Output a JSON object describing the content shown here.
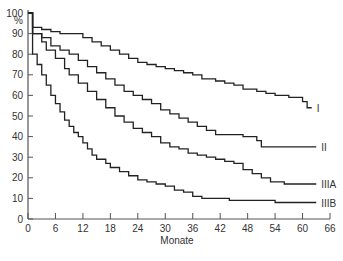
{
  "chart_data": {
    "type": "line",
    "style": "step (Kaplan-Meier survival curves)",
    "title": "",
    "xlabel": "Monate",
    "ylabel": "%",
    "xlim": [
      0,
      66
    ],
    "ylim": [
      0,
      100
    ],
    "x_ticks": [
      0,
      6,
      12,
      18,
      24,
      30,
      36,
      42,
      48,
      54,
      60,
      66
    ],
    "y_ticks": [
      0,
      10,
      20,
      30,
      40,
      50,
      60,
      70,
      80,
      90,
      100
    ],
    "grid": false,
    "legend": "inline labels at right end of each curve",
    "series": [
      {
        "name": "I",
        "points": [
          [
            0,
            100
          ],
          [
            1,
            97
          ],
          [
            1,
            93
          ],
          [
            3,
            92
          ],
          [
            5,
            91
          ],
          [
            7,
            90
          ],
          [
            10,
            90
          ],
          [
            12,
            88
          ],
          [
            14,
            86
          ],
          [
            16,
            84
          ],
          [
            18,
            82
          ],
          [
            20,
            80
          ],
          [
            22,
            78
          ],
          [
            24,
            76
          ],
          [
            26,
            75
          ],
          [
            28,
            74
          ],
          [
            30,
            73
          ],
          [
            32,
            72
          ],
          [
            34,
            71
          ],
          [
            36,
            70
          ],
          [
            38,
            68
          ],
          [
            41,
            67
          ],
          [
            43,
            66
          ],
          [
            45,
            65
          ],
          [
            47,
            63
          ],
          [
            50,
            62
          ],
          [
            52,
            61
          ],
          [
            54,
            60
          ],
          [
            57,
            59
          ],
          [
            60,
            57
          ],
          [
            61,
            54
          ],
          [
            62,
            54
          ]
        ]
      },
      {
        "name": "II",
        "points": [
          [
            0,
            100
          ],
          [
            1,
            95
          ],
          [
            1,
            90
          ],
          [
            3,
            88
          ],
          [
            5,
            84
          ],
          [
            7,
            82
          ],
          [
            9,
            80
          ],
          [
            11,
            77
          ],
          [
            13,
            74
          ],
          [
            15,
            71
          ],
          [
            17,
            68
          ],
          [
            19,
            65
          ],
          [
            21,
            62
          ],
          [
            23,
            60
          ],
          [
            25,
            58
          ],
          [
            27,
            56
          ],
          [
            29,
            53
          ],
          [
            31,
            51
          ],
          [
            33,
            49
          ],
          [
            35,
            47
          ],
          [
            37,
            45
          ],
          [
            39,
            43
          ],
          [
            41,
            41
          ],
          [
            46,
            41
          ],
          [
            47,
            40
          ],
          [
            50,
            38
          ],
          [
            51,
            35
          ],
          [
            63,
            35
          ]
        ]
      },
      {
        "name": "IIIA",
        "points": [
          [
            0,
            100
          ],
          [
            1,
            90
          ],
          [
            3,
            86
          ],
          [
            4,
            82
          ],
          [
            6,
            78
          ],
          [
            8,
            73
          ],
          [
            9,
            70
          ],
          [
            11,
            66
          ],
          [
            13,
            62
          ],
          [
            15,
            58
          ],
          [
            17,
            54
          ],
          [
            19,
            50
          ],
          [
            21,
            47
          ],
          [
            23,
            44
          ],
          [
            25,
            42
          ],
          [
            27,
            40
          ],
          [
            29,
            37
          ],
          [
            31,
            35
          ],
          [
            33,
            34
          ],
          [
            35,
            32
          ],
          [
            37,
            31
          ],
          [
            39,
            30
          ],
          [
            41,
            29
          ],
          [
            43,
            28
          ],
          [
            45,
            27
          ],
          [
            47,
            24
          ],
          [
            49,
            22
          ],
          [
            51,
            20
          ],
          [
            53,
            18
          ],
          [
            56,
            17
          ],
          [
            63,
            17
          ]
        ]
      },
      {
        "name": "IIIB",
        "points": [
          [
            0,
            100
          ],
          [
            1,
            80
          ],
          [
            2,
            75
          ],
          [
            3,
            70
          ],
          [
            4,
            65
          ],
          [
            5,
            60
          ],
          [
            6,
            56
          ],
          [
            7,
            52
          ],
          [
            8,
            48
          ],
          [
            9,
            45
          ],
          [
            10,
            42
          ],
          [
            11,
            40
          ],
          [
            12,
            37
          ],
          [
            13,
            34
          ],
          [
            14,
            31
          ],
          [
            15,
            29
          ],
          [
            17,
            27
          ],
          [
            18,
            25
          ],
          [
            20,
            23
          ],
          [
            22,
            21
          ],
          [
            24,
            19
          ],
          [
            26,
            18
          ],
          [
            28,
            17
          ],
          [
            30,
            16
          ],
          [
            32,
            14
          ],
          [
            34,
            13
          ],
          [
            36,
            11
          ],
          [
            38,
            10
          ],
          [
            42,
            10
          ],
          [
            44,
            9
          ],
          [
            53,
            9
          ],
          [
            54,
            8
          ],
          [
            63,
            8
          ]
        ]
      }
    ],
    "labels": {
      "I": "I",
      "II": "II",
      "IIIA": "IIIA",
      "IIIB": "IIIB"
    }
  },
  "axes": {
    "y_unit": "%",
    "x_title": "Monate"
  }
}
